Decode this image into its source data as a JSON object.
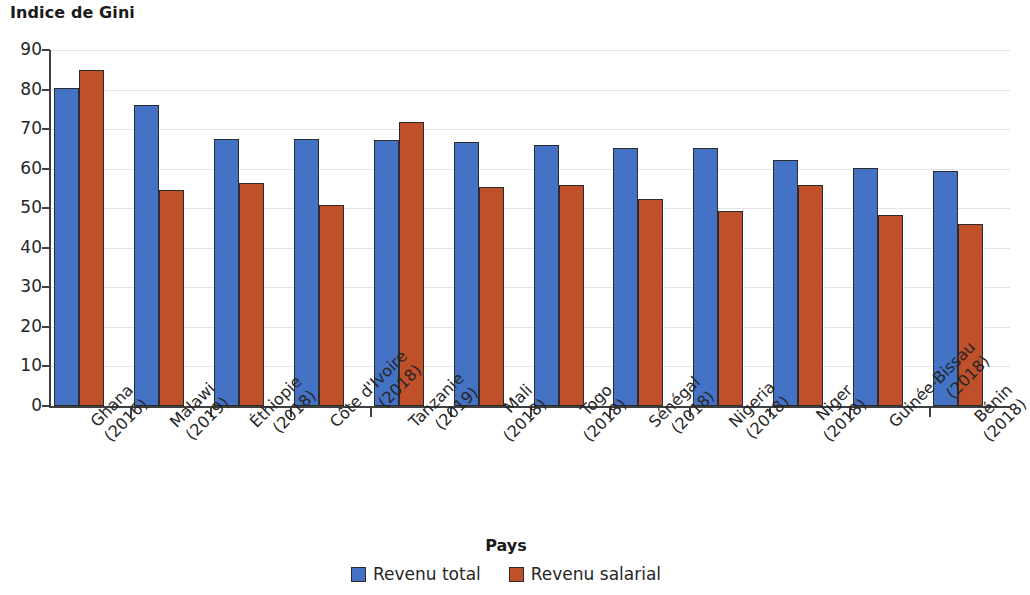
{
  "chart_data": {
    "type": "bar",
    "title": "Indice de Gini",
    "xlabel": "Pays",
    "ylabel": "",
    "ylim": [
      0,
      90
    ],
    "yticks": [
      0,
      10,
      20,
      30,
      40,
      50,
      60,
      70,
      80,
      90
    ],
    "grid": true,
    "legend_position": "bottom",
    "categories": [
      "Ghana (2016)",
      "Malawi (2019)",
      "Éthiopie (2018)",
      "Côte d'Ivoire (2018)",
      "Tanzanie (2019)",
      "Mali (2018)",
      "Togo (2018)",
      "Sénégal (2018)",
      "Nigeria (2018)",
      "Niger (2018)",
      "Guinée-Bissau (2018)",
      "Bénin (2018)"
    ],
    "category_lines": [
      [
        "Ghana",
        "(2016)"
      ],
      [
        "Malawi",
        "(2019)"
      ],
      [
        "Éthiopie",
        "(2018)"
      ],
      [
        "Côte d'Ivoire",
        "(2018)"
      ],
      [
        "Tanzanie",
        "(2019)"
      ],
      [
        "Mali",
        "(2018)"
      ],
      [
        "Togo",
        "(2018)"
      ],
      [
        "Sénégal",
        "(2018)"
      ],
      [
        "Nigeria",
        "(2018)"
      ],
      [
        "Niger",
        "(2018)"
      ],
      [
        "Guinée-Bissau",
        "(2018)"
      ],
      [
        "Bénin",
        "(2018)"
      ]
    ],
    "series": [
      {
        "name": "Revenu total",
        "color": "#4472c4",
        "values": [
          80.5,
          76.0,
          67.5,
          67.5,
          67.2,
          66.7,
          66.0,
          65.3,
          65.3,
          62.3,
          60.1,
          59.3
        ]
      },
      {
        "name": "Revenu salarial",
        "color": "#c0502a",
        "values": [
          84.9,
          54.6,
          56.5,
          50.7,
          71.7,
          55.3,
          56.0,
          52.4,
          49.4,
          55.9,
          48.3,
          45.9
        ]
      }
    ]
  },
  "colors": {
    "series_total": "#4472c4",
    "series_salary": "#c0502a",
    "axis": "#3f3f3f",
    "grid": "#e2e2e8",
    "text": "#262626"
  }
}
